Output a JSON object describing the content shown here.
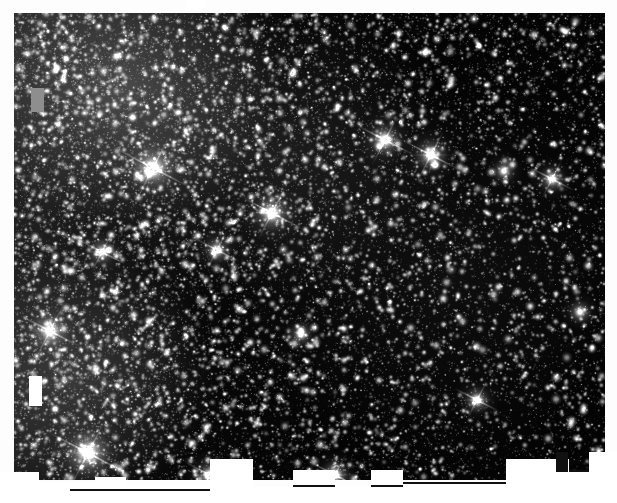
{
  "page": {
    "background_color": "#fdfdfd",
    "width": 617,
    "height": 503
  },
  "image": {
    "name": "star-field-plate",
    "type": "astronomical-photographic-plate",
    "description": "Dense field of unresolved and resolved stars, grayscale negative-free positive print",
    "frame": {
      "left": 14,
      "top": 13,
      "width": 591,
      "height": 467
    },
    "background_color": "#040404",
    "star_color": "#ffffff",
    "haze_color": "#8a8a8a",
    "star_count_label": "",
    "bright_stars": [
      {
        "x": 139,
        "y": 155,
        "radius": 13,
        "brightness": 1.0,
        "spikes": true
      },
      {
        "x": 258,
        "y": 200,
        "radius": 11,
        "brightness": 0.96,
        "spikes": true
      },
      {
        "x": 371,
        "y": 127,
        "radius": 10,
        "brightness": 0.94,
        "spikes": true
      },
      {
        "x": 417,
        "y": 142,
        "radius": 10,
        "brightness": 0.92,
        "spikes": true
      },
      {
        "x": 36,
        "y": 318,
        "radius": 11,
        "brightness": 0.95,
        "spikes": true
      },
      {
        "x": 74,
        "y": 440,
        "radius": 14,
        "brightness": 1.0,
        "spikes": true
      },
      {
        "x": 196,
        "y": 462,
        "radius": 9,
        "brightness": 0.9,
        "spikes": true
      },
      {
        "x": 321,
        "y": 462,
        "radius": 9,
        "brightness": 0.9,
        "spikes": true
      },
      {
        "x": 463,
        "y": 387,
        "radius": 8,
        "brightness": 0.88,
        "spikes": true
      },
      {
        "x": 538,
        "y": 166,
        "radius": 8,
        "brightness": 0.86,
        "spikes": true
      },
      {
        "x": 88,
        "y": 239,
        "radius": 8,
        "brightness": 0.85,
        "spikes": true
      },
      {
        "x": 203,
        "y": 237,
        "radius": 8,
        "brightness": 0.84,
        "spikes": true
      },
      {
        "x": 287,
        "y": 321,
        "radius": 7,
        "brightness": 0.82,
        "spikes": false
      },
      {
        "x": 490,
        "y": 158,
        "radius": 7,
        "brightness": 0.8,
        "spikes": false
      },
      {
        "x": 566,
        "y": 299,
        "radius": 7,
        "brightness": 0.8,
        "spikes": false
      }
    ],
    "mask_blocks": [
      {
        "name": "white-mask-left",
        "x": 29,
        "y": 376,
        "width": 13,
        "height": 30,
        "color": "#ffffff"
      },
      {
        "name": "gray-mask-upper-left",
        "x": 31,
        "y": 88,
        "width": 13,
        "height": 24,
        "color": "#8e8e8e"
      }
    ],
    "bottom_notches": [
      {
        "x": 0,
        "y": 472,
        "width": 39,
        "height": 31
      },
      {
        "x": 39,
        "y": 483,
        "width": 56,
        "height": 20
      },
      {
        "x": 95,
        "y": 477,
        "width": 31,
        "height": 26
      },
      {
        "x": 126,
        "y": 486,
        "width": 84,
        "height": 17
      },
      {
        "x": 210,
        "y": 459,
        "width": 43,
        "height": 44
      },
      {
        "x": 253,
        "y": 487,
        "width": 40,
        "height": 16
      },
      {
        "x": 293,
        "y": 470,
        "width": 42,
        "height": 33
      },
      {
        "x": 335,
        "y": 486,
        "width": 36,
        "height": 17
      },
      {
        "x": 371,
        "y": 470,
        "width": 32,
        "height": 33
      },
      {
        "x": 403,
        "y": 484,
        "width": 103,
        "height": 19
      },
      {
        "x": 506,
        "y": 459,
        "width": 63,
        "height": 44
      },
      {
        "x": 569,
        "y": 472,
        "width": 20,
        "height": 31
      },
      {
        "x": 589,
        "y": 452,
        "width": 28,
        "height": 51
      }
    ],
    "top_notch": {
      "x": 186,
      "y": 0,
      "width": 20,
      "height": 13
    }
  },
  "controls": {
    "zoom_label": "",
    "caption": ""
  }
}
